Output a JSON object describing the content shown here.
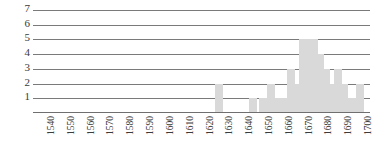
{
  "chart_data": {
    "type": "bar",
    "title": "",
    "subtitle": "",
    "xlabel": "",
    "ylabel": "",
    "xlim": [
      1535,
      1705
    ],
    "ylim": [
      0,
      7
    ],
    "grid": true,
    "legend": null,
    "bar_color": "#d9d9d9",
    "axis_color": "#7a7a7a",
    "bar_width_years": 4,
    "y_ticks": [
      1,
      2,
      3,
      4,
      5,
      6,
      7
    ],
    "y_tick_labels": [
      "1",
      "2",
      "3",
      "4",
      "5",
      "6",
      "7"
    ],
    "x_ticks": [
      1540,
      1550,
      1560,
      1570,
      1580,
      1590,
      1600,
      1610,
      1620,
      1630,
      1640,
      1650,
      1660,
      1670,
      1680,
      1690,
      1700
    ],
    "x_tick_labels": [
      "1540",
      "1550",
      "1560",
      "1570",
      "1580",
      "1590",
      "1600",
      "1610",
      "1620",
      "1630",
      "1640",
      "1650",
      "1660",
      "1670",
      "1680",
      "1690",
      "1700"
    ],
    "x": [
      1629,
      1646,
      1651,
      1655,
      1659,
      1662,
      1665,
      1668,
      1671,
      1674,
      1677,
      1680,
      1683,
      1686,
      1689,
      1692,
      1696,
      1700
    ],
    "values": [
      2,
      1,
      1,
      2,
      1,
      1,
      3,
      2,
      5,
      5,
      5,
      4,
      3,
      2,
      3,
      2,
      1,
      2
    ],
    "categories": [
      "1629",
      "1646",
      "1651",
      "1655",
      "1659",
      "1662",
      "1665",
      "1668",
      "1671",
      "1674",
      "1677",
      "1680",
      "1683",
      "1686",
      "1689",
      "1692",
      "1696",
      "1700"
    ],
    "annotations": []
  }
}
